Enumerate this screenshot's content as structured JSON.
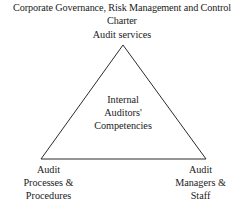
{
  "diagram": {
    "title": {
      "lines": [
        "Corporate Governance, Risk Management and Control",
        "Charter"
      ]
    },
    "apex_label": "Audit services",
    "center_label": {
      "lines": [
        "Internal",
        "Auditors'",
        "Competencies"
      ]
    },
    "corners": [
      {
        "id": "bottom-left",
        "lines": [
          "Audit",
          "Processes &",
          "Procedures"
        ]
      },
      {
        "id": "bottom-right",
        "lines": [
          "Audit",
          "Managers &",
          "Staff"
        ]
      }
    ],
    "shape": {
      "type": "triangle",
      "apex": {
        "x": 123,
        "y": 45
      },
      "base_left": {
        "x": 41,
        "y": 159
      },
      "base_right": {
        "x": 206,
        "y": 159
      },
      "stroke_color": "#2b2b2b",
      "stroke_width": 1,
      "fill": "none"
    },
    "colors": {
      "background": "#ffffff",
      "text": "#1a1a1a",
      "line": "#2b2b2b"
    }
  }
}
